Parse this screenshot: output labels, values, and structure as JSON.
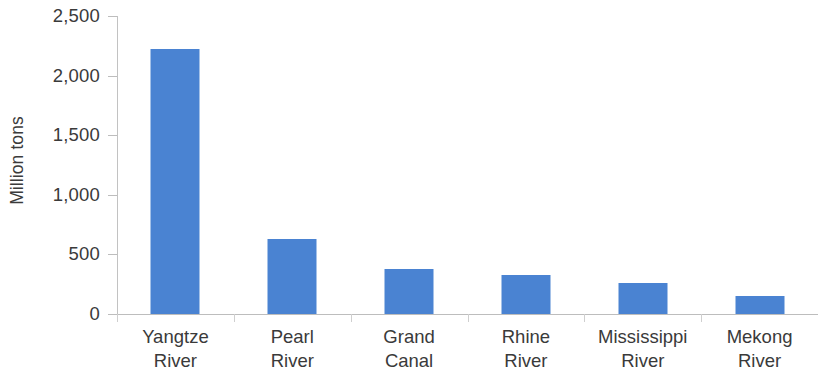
{
  "chart_data": {
    "type": "bar",
    "title": "",
    "subtitle": "",
    "xlabel": "",
    "ylabel": "Million tons",
    "ylim": [
      0,
      2500
    ],
    "ytick_step": 500,
    "grid": false,
    "legend": null,
    "bar_color": "#4a83d2",
    "axis_color": "#bdbdbd",
    "text_color": "#3a3a3a",
    "categories": [
      "Yangtze River",
      "Pearl River",
      "Grand Canal",
      "Rhine River",
      "Mississippi River",
      "Mekong River"
    ],
    "category_lines": [
      [
        "Yangtze",
        "River"
      ],
      [
        "Pearl",
        "River"
      ],
      [
        "Grand",
        "Canal"
      ],
      [
        "Rhine",
        "River"
      ],
      [
        "Mississippi",
        "River"
      ],
      [
        "Mekong",
        "River"
      ]
    ],
    "values": [
      2220,
      630,
      375,
      325,
      260,
      155
    ],
    "ytick_labels": [
      "0",
      "500",
      "1,000",
      "1,500",
      "2,000",
      "2,500"
    ],
    "ytick_values": [
      0,
      500,
      1000,
      1500,
      2000,
      2500
    ]
  }
}
